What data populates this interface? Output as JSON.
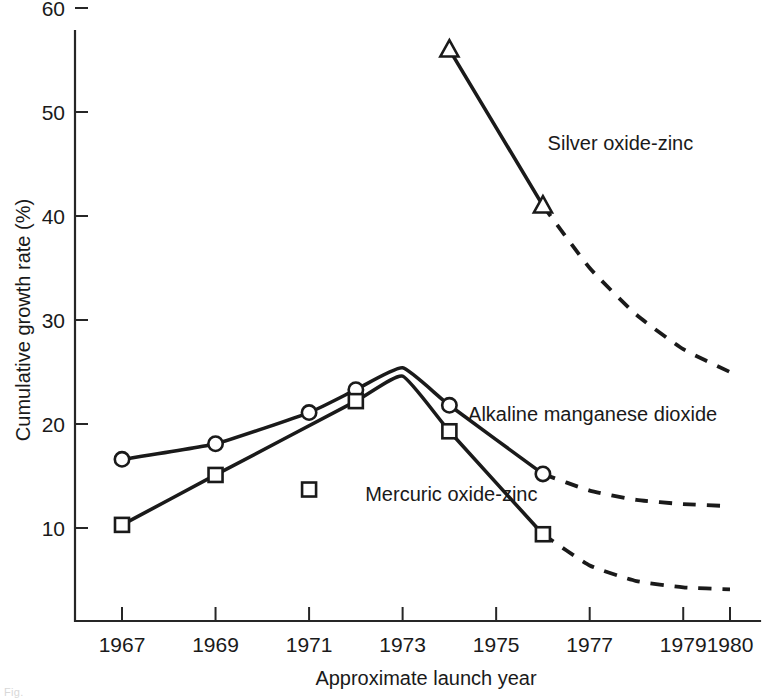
{
  "figure": {
    "caption_fragment": "Fig."
  },
  "chart_data": {
    "type": "line",
    "title": "",
    "xlabel": "Approximate launch year",
    "ylabel": "Cumulative growth rate (%)",
    "xlim": [
      1966.3,
      1980.6
    ],
    "ylim": [
      0,
      62
    ],
    "grid": false,
    "legend": "inline-labels",
    "x_ticks": [
      1967,
      1969,
      1971,
      1973,
      1975,
      1977,
      1979,
      1980
    ],
    "x_tick_labels": [
      "1967",
      "1969",
      "1971",
      "1973",
      "1975",
      "1977",
      "1979",
      "1980"
    ],
    "y_ticks": [
      10,
      20,
      30,
      40,
      50,
      60
    ],
    "y_tick_labels": [
      "10",
      "20",
      "30",
      "40",
      "50",
      "60"
    ],
    "series": [
      {
        "name": "Silver oxide-zinc",
        "label": "Silver oxide-zinc",
        "marker": "triangle",
        "solid": {
          "x": [
            1974,
            1976
          ],
          "y": [
            56.0,
            41.0
          ]
        },
        "dashed": {
          "x": [
            1976,
            1977,
            1978,
            1979,
            1980
          ],
          "y": [
            41.0,
            35.0,
            30.5,
            27.2,
            25.0
          ]
        },
        "markers": {
          "x": [
            1974,
            1976
          ],
          "y": [
            56.0,
            41.0
          ]
        },
        "label_pos": {
          "x": 1976.1,
          "y": 47.0
        }
      },
      {
        "name": "Alkaline manganese dioxide",
        "label": "Alkaline manganese dioxide",
        "marker": "circle",
        "solid": {
          "x": [
            1967,
            1969,
            1971,
            1972,
            1973,
            1974,
            1976
          ],
          "y": [
            16.6,
            18.1,
            21.1,
            23.3,
            25.4,
            21.8,
            15.2
          ]
        },
        "dashed": {
          "x": [
            1976,
            1977,
            1978,
            1979,
            1980
          ],
          "y": [
            15.2,
            13.6,
            12.7,
            12.3,
            12.1
          ]
        },
        "markers": {
          "x": [
            1967,
            1969,
            1971,
            1972,
            1974,
            1976
          ],
          "y": [
            16.6,
            18.1,
            21.1,
            23.3,
            21.8,
            15.2
          ]
        },
        "label_pos": {
          "x": 1974.4,
          "y": 21.0
        }
      },
      {
        "name": "Mercuric oxide-zinc",
        "label": "Mercuric oxide-zinc",
        "marker": "square",
        "solid": {
          "x": [
            1967,
            1969,
            1972,
            1973,
            1974,
            1976
          ],
          "y": [
            10.3,
            15.1,
            22.2,
            24.6,
            19.3,
            9.4
          ]
        },
        "dashed": {
          "x": [
            1976,
            1977,
            1978,
            1979,
            1980
          ],
          "y": [
            9.4,
            6.4,
            4.9,
            4.3,
            4.1
          ]
        },
        "markers": {
          "x": [
            1967,
            1969,
            1972,
            1974,
            1976
          ],
          "y": [
            10.3,
            15.1,
            22.2,
            19.3,
            9.4
          ]
        },
        "orphan_markers": {
          "x": [
            1971
          ],
          "y": [
            13.7
          ]
        },
        "label_pos": {
          "x": 1972.2,
          "y": 13.3
        }
      }
    ]
  }
}
